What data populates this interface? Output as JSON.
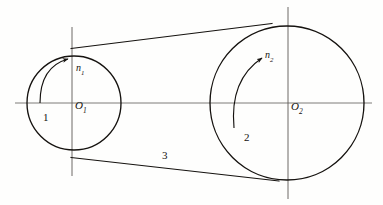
{
  "figure": {
    "kind": "belt-drive-schematic",
    "background_color": "#fefefd",
    "line_color": "#15120f",
    "axis_color": "#55524e",
    "width": 383,
    "height": 205
  },
  "pulleys": {
    "small": {
      "part_label": "1",
      "center_label": "O",
      "center_subscript": "1",
      "speed_label": "n",
      "speed_subscript": "1",
      "center_x": 74,
      "center_y": 103,
      "radius": 47,
      "rotation_direction": "clockwise"
    },
    "large": {
      "part_label": "2",
      "center_label": "O",
      "center_subscript": "2",
      "speed_label": "n",
      "speed_subscript": "2",
      "center_x": 287,
      "center_y": 103,
      "radius": 77,
      "rotation_direction": "clockwise"
    }
  },
  "belt": {
    "part_label": "3",
    "upper_start_x": 72,
    "upper_start_y": 48,
    "upper_end_x": 271,
    "upper_end_y": 24,
    "lower_start_x": 72,
    "lower_start_y": 158,
    "lower_end_x": 277,
    "lower_end_y": 180
  },
  "axes": {
    "horizontal_y": 103,
    "horizontal_x1": 15,
    "horizontal_x2": 372,
    "small_vertical_x": 72,
    "small_vertical_y1": 27,
    "small_vertical_y2": 176,
    "large_vertical_x": 288,
    "large_vertical_y1": 7,
    "large_vertical_y2": 199
  }
}
